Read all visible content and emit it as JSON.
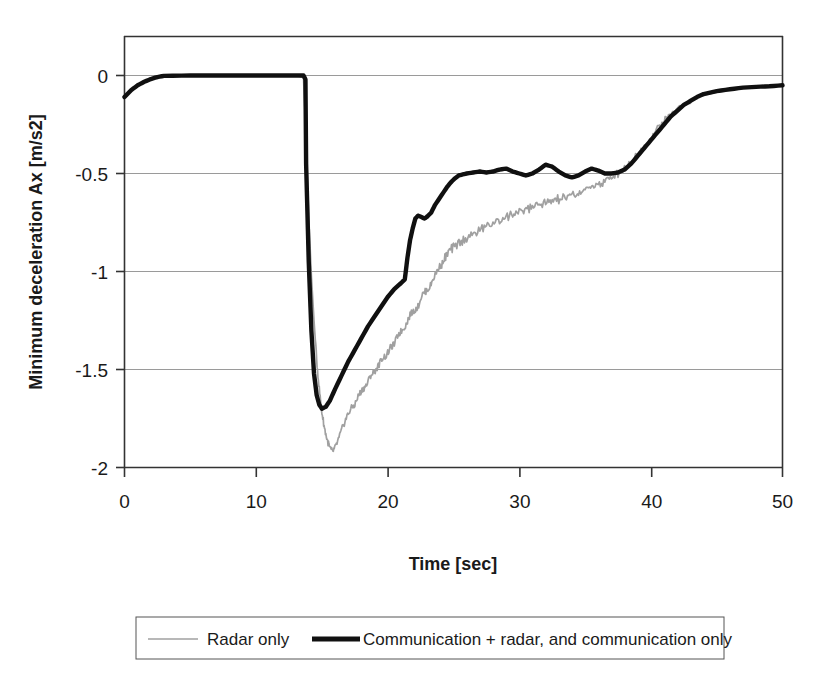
{
  "chart_data": {
    "type": "line",
    "title": "",
    "xlabel": "Time [sec]",
    "ylabel": "Minimum deceleration Ax [m/s2]",
    "xlim": [
      0,
      50
    ],
    "ylim": [
      -2,
      0.17
    ],
    "xticks": [
      0,
      10,
      20,
      30,
      40,
      50
    ],
    "xtick_labels": [
      "0",
      "10",
      "20",
      "30",
      "40",
      "50"
    ],
    "yticks": [
      0,
      -0.5,
      -1,
      -1.5,
      -2
    ],
    "ytick_labels": [
      "0",
      "-0.5",
      "-1",
      "-1.5",
      "-2"
    ],
    "grid": "horizontal",
    "legend_position": "below-plot",
    "colors": {
      "radar_only": "#a0a0a0",
      "communication": "#101010",
      "grid": "#9a9a9a",
      "axis": "#333333",
      "background": "#ffffff"
    },
    "series": [
      {
        "name": "Radar only",
        "style": "thin-gray-noisy",
        "color": "#a0a0a0",
        "x": [
          0,
          0.5,
          1,
          1.5,
          2,
          2.5,
          3,
          5,
          8,
          11,
          13,
          13.6,
          13.8,
          14.0,
          14.2,
          14.4,
          14.6,
          14.8,
          15.0,
          15.2,
          15.4,
          15.6,
          15.8,
          16.0,
          16.3,
          16.6,
          16.9,
          17.2,
          17.5,
          17.8,
          18.1,
          18.4,
          18.7,
          19.0,
          19.3,
          19.6,
          19.9,
          20.2,
          20.5,
          20.8,
          21.1,
          21.4,
          21.7,
          22.0,
          22.3,
          22.6,
          22.9,
          23.2,
          23.5,
          23.8,
          24.1,
          24.4,
          24.7,
          25.0,
          25.5,
          26.0,
          26.5,
          27.0,
          27.5,
          28.0,
          28.5,
          29.0,
          29.5,
          30.0,
          30.5,
          31.0,
          31.5,
          32.0,
          32.5,
          33.0,
          33.5,
          34.0,
          34.5,
          35.0,
          35.5,
          36.0,
          36.5,
          37.0,
          37.5,
          38.0,
          38.5,
          39.0,
          39.5,
          40.0,
          40.5,
          41.0,
          41.5,
          42.0,
          43.0,
          44.0,
          45.0,
          46.0,
          47.0,
          48.0,
          49.0,
          50.0
        ],
        "y": [
          -0.11,
          -0.075,
          -0.05,
          -0.032,
          -0.018,
          -0.008,
          -0.002,
          0.0,
          0.0,
          0.0,
          0.0,
          -0.01,
          -0.32,
          -0.72,
          -1.02,
          -1.25,
          -1.45,
          -1.6,
          -1.72,
          -1.8,
          -1.86,
          -1.9,
          -1.92,
          -1.9,
          -1.85,
          -1.79,
          -1.74,
          -1.7,
          -1.68,
          -1.63,
          -1.6,
          -1.58,
          -1.53,
          -1.51,
          -1.48,
          -1.44,
          -1.43,
          -1.39,
          -1.37,
          -1.32,
          -1.3,
          -1.27,
          -1.22,
          -1.2,
          -1.18,
          -1.12,
          -1.1,
          -1.08,
          -1.03,
          -0.99,
          -0.96,
          -0.93,
          -0.9,
          -0.88,
          -0.85,
          -0.83,
          -0.81,
          -0.79,
          -0.77,
          -0.75,
          -0.74,
          -0.72,
          -0.71,
          -0.7,
          -0.68,
          -0.67,
          -0.66,
          -0.65,
          -0.64,
          -0.63,
          -0.62,
          -0.61,
          -0.6,
          -0.59,
          -0.57,
          -0.555,
          -0.54,
          -0.52,
          -0.5,
          -0.47,
          -0.44,
          -0.4,
          -0.36,
          -0.32,
          -0.27,
          -0.23,
          -0.2,
          -0.17,
          -0.13,
          -0.1,
          -0.085,
          -0.07,
          -0.06,
          -0.055,
          -0.05,
          -0.05
        ]
      },
      {
        "name": "Communication + radar, and communication only",
        "style": "thick-black",
        "color": "#101010",
        "x": [
          0,
          0.5,
          1,
          1.5,
          2,
          2.5,
          3,
          5,
          8,
          11,
          13,
          13.6,
          13.75,
          13.8,
          14.0,
          14.2,
          14.4,
          14.6,
          14.8,
          15.0,
          15.3,
          15.6,
          16.0,
          16.5,
          17.0,
          17.5,
          18.0,
          18.5,
          19.0,
          19.5,
          20.0,
          20.5,
          21.0,
          21.3,
          21.5,
          21.7,
          21.9,
          22.1,
          22.3,
          22.5,
          22.8,
          23.0,
          23.3,
          23.6,
          23.9,
          24.2,
          24.5,
          24.8,
          25.1,
          25.4,
          25.7,
          26.0,
          26.5,
          27.0,
          27.5,
          28.0,
          28.5,
          29.0,
          29.5,
          30.0,
          30.5,
          31.0,
          31.5,
          32.0,
          32.5,
          33.0,
          33.5,
          34.0,
          34.5,
          35.0,
          35.5,
          36.0,
          36.5,
          37.0,
          37.5,
          38.0,
          38.5,
          39.0,
          39.5,
          40.0,
          40.5,
          41.0,
          41.5,
          42.0,
          42.5,
          43.0,
          43.5,
          44.0,
          45.0,
          46.0,
          47.0,
          48.0,
          49.0,
          50.0
        ],
        "y": [
          -0.11,
          -0.075,
          -0.05,
          -0.032,
          -0.018,
          -0.008,
          -0.002,
          0.0,
          0.0,
          0.0,
          0.0,
          0.0,
          -0.02,
          -0.45,
          -0.95,
          -1.3,
          -1.52,
          -1.63,
          -1.68,
          -1.7,
          -1.69,
          -1.66,
          -1.6,
          -1.53,
          -1.46,
          -1.4,
          -1.34,
          -1.28,
          -1.23,
          -1.18,
          -1.13,
          -1.09,
          -1.06,
          -1.04,
          -0.93,
          -0.84,
          -0.78,
          -0.73,
          -0.715,
          -0.72,
          -0.73,
          -0.72,
          -0.7,
          -0.66,
          -0.63,
          -0.6,
          -0.57,
          -0.545,
          -0.525,
          -0.51,
          -0.505,
          -0.5,
          -0.495,
          -0.49,
          -0.495,
          -0.49,
          -0.48,
          -0.475,
          -0.49,
          -0.5,
          -0.51,
          -0.5,
          -0.48,
          -0.455,
          -0.465,
          -0.49,
          -0.51,
          -0.52,
          -0.51,
          -0.49,
          -0.475,
          -0.485,
          -0.5,
          -0.5,
          -0.495,
          -0.48,
          -0.45,
          -0.41,
          -0.37,
          -0.33,
          -0.29,
          -0.25,
          -0.21,
          -0.18,
          -0.15,
          -0.13,
          -0.11,
          -0.095,
          -0.08,
          -0.07,
          -0.062,
          -0.058,
          -0.055,
          -0.05
        ]
      }
    ]
  },
  "axes": {
    "y_title": "Minimum deceleration Ax [m/s2]",
    "x_title": "Time [sec]",
    "y_ticks": [
      "0",
      "-0.5",
      "-1",
      "-1.5",
      "-2"
    ],
    "x_ticks": [
      "0",
      "10",
      "20",
      "30",
      "40",
      "50"
    ]
  },
  "legend": {
    "items": [
      {
        "label": "Radar only",
        "swatch": "thin-gray-line"
      },
      {
        "label": "Communication + radar, and communication only",
        "swatch": "thick-black-line"
      }
    ]
  }
}
